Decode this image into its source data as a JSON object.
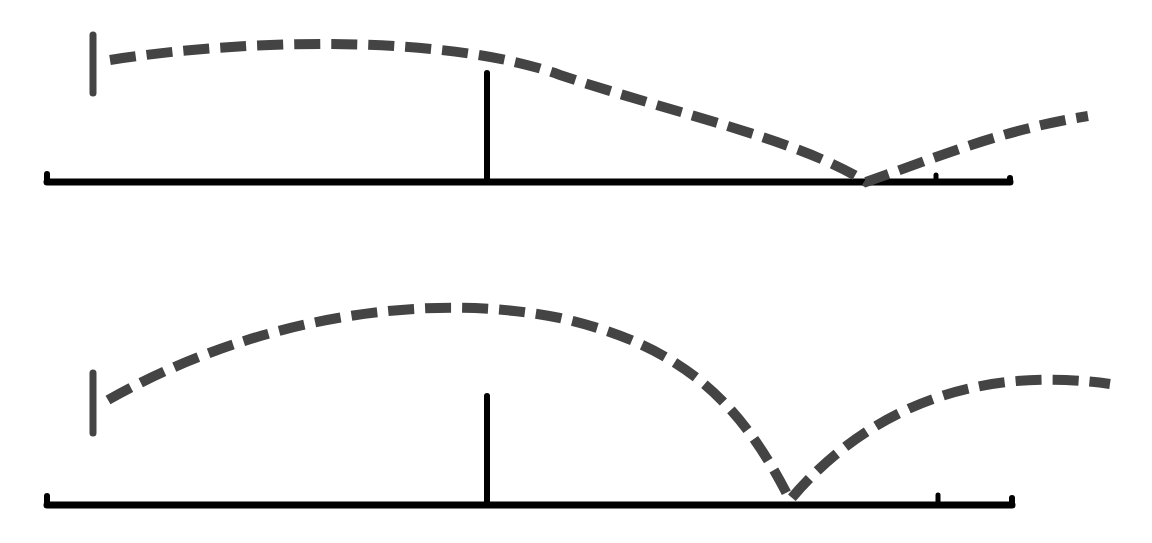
{
  "diagram": {
    "type": "trajectory-comparison",
    "colors": {
      "background": "#ffffff",
      "baseline": "#000000",
      "trajectory": "#444444",
      "marker": "#444444"
    },
    "panels": [
      {
        "id": "top",
        "baseline": {
          "x1": 47,
          "x2": 1010,
          "y": 182
        },
        "left_end_tick": {
          "x": 47,
          "y_top": 174
        },
        "right_end_tick": {
          "x": 1010,
          "y_top": 182
        },
        "small_tick": {
          "x": 936,
          "y_top": 179
        },
        "center_post": {
          "x": 487,
          "y_top": 73,
          "y_bottom": 182
        },
        "launch_marker": {
          "x": 93,
          "y_top": 35,
          "y_bottom": 93
        },
        "trajectory": {
          "style": "dashed",
          "path": "M 110 60 C 250 38, 450 35, 560 75 C 680 115, 800 140, 866 182 C 930 160, 1000 130, 1088 116",
          "bounce_point": {
            "x": 866,
            "y": 182
          },
          "end_point": {
            "x": 1088,
            "y": 116
          }
        }
      },
      {
        "id": "bottom",
        "baseline": {
          "x1": 47,
          "x2": 1012,
          "y": 505
        },
        "left_end_tick": {
          "x": 47,
          "y_top": 496
        },
        "right_end_tick": {
          "x": 1012,
          "y_top": 502
        },
        "small_tick": {
          "x": 938,
          "y_top": 499
        },
        "center_post": {
          "x": 487,
          "y_top": 396,
          "y_bottom": 505
        },
        "launch_marker": {
          "x": 93,
          "y_top": 373,
          "y_bottom": 433
        },
        "trajectory": {
          "style": "dashed",
          "path": "M 108 400 C 250 320, 420 290, 560 318 C 680 345, 740 400, 790 500 C 840 440, 940 360, 1110 384",
          "bounce_point": {
            "x": 790,
            "y": 500
          },
          "end_point": {
            "x": 1110,
            "y": 384
          }
        }
      }
    ]
  }
}
